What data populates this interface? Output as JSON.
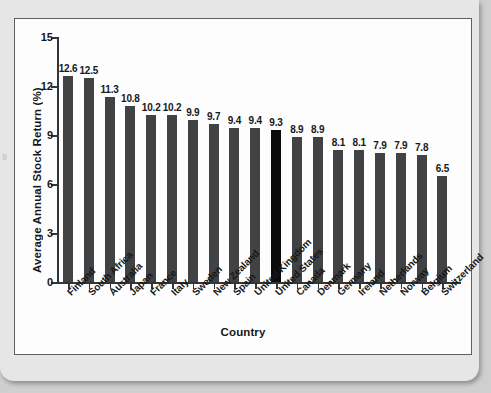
{
  "chart_data": {
    "type": "bar",
    "title": "",
    "xlabel": "Country",
    "ylabel": "Average Annual Stock Return (%)",
    "ylim": [
      0,
      15
    ],
    "yticks": [
      0,
      3,
      6,
      9,
      12,
      15
    ],
    "grid": false,
    "legend": "none",
    "highlight_category": "United States",
    "bar_color": "#414244",
    "highlight_color": "#0b0b0c",
    "categories": [
      "Finland",
      "South Africa",
      "Australia",
      "Japan",
      "France",
      "Italy",
      "Sweden",
      "New Zealand",
      "Spain",
      "United Kingdom",
      "United States",
      "Canada",
      "Denmark",
      "Germany",
      "Ireland",
      "Netherlands",
      "Norway",
      "Belgium",
      "Switzerland"
    ],
    "values": [
      12.6,
      12.5,
      11.3,
      10.8,
      10.2,
      10.2,
      9.9,
      9.7,
      9.4,
      9.4,
      9.3,
      8.9,
      8.9,
      8.1,
      8.1,
      7.9,
      7.9,
      7.8,
      6.5
    ],
    "value_labels": [
      "12.6",
      "12.5",
      "11.3",
      "10.8",
      "10.2",
      "10.2",
      "9.9",
      "9.7",
      "9.4",
      "9.4",
      "9.3",
      "8.9",
      "8.9",
      "8.1",
      "8.1",
      "7.9",
      "7.9",
      "7.8",
      "6.5"
    ],
    "ytick_labels": [
      "0",
      "3",
      "6",
      "9",
      "12",
      "15"
    ]
  },
  "figure": {
    "margin_artifact": "9"
  }
}
